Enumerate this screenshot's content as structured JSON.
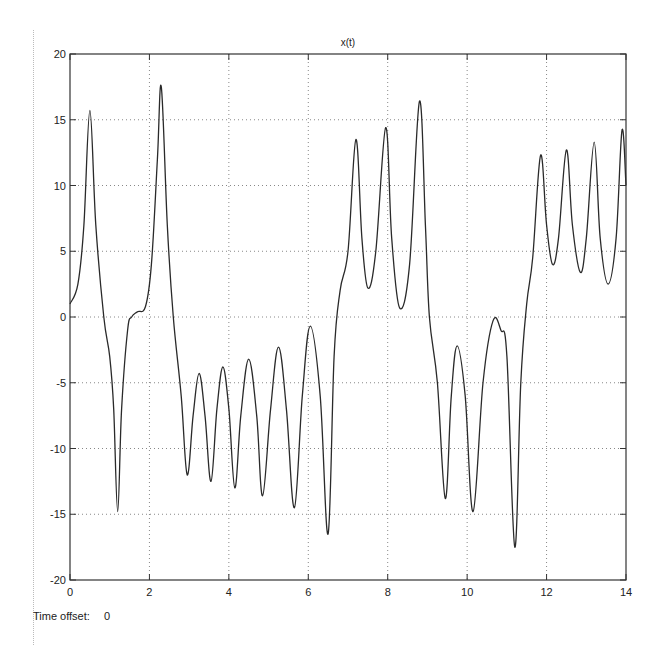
{
  "window": {
    "time_offset_label": "Time offset:",
    "time_offset_value": "0"
  },
  "chart_data": {
    "type": "line",
    "title": "x(t)",
    "xlabel": "",
    "ylabel": "",
    "xlim": [
      0,
      14
    ],
    "ylim": [
      -20,
      20
    ],
    "grid": true,
    "legend": null,
    "x_ticks": [
      0,
      2,
      4,
      6,
      8,
      10,
      12,
      14
    ],
    "y_ticks": [
      -20,
      -15,
      -10,
      -5,
      0,
      5,
      10,
      15,
      20
    ],
    "series": [
      {
        "name": "x(t)",
        "color": "#2a2a2a",
        "x": [
          0,
          0.2,
          0.35,
          0.5,
          0.65,
          0.85,
          1.0,
          1.1,
          1.2,
          1.3,
          1.45,
          1.55,
          1.7,
          1.9,
          2.05,
          2.2,
          2.3,
          2.45,
          2.6,
          2.8,
          2.95,
          3.1,
          3.25,
          3.4,
          3.55,
          3.7,
          3.85,
          4.0,
          4.15,
          4.3,
          4.5,
          4.7,
          4.85,
          5.05,
          5.25,
          5.45,
          5.65,
          5.85,
          6.05,
          6.3,
          6.5,
          6.65,
          6.8,
          7.0,
          7.2,
          7.35,
          7.5,
          7.7,
          7.95,
          8.1,
          8.3,
          8.55,
          8.8,
          8.95,
          9.05,
          9.25,
          9.45,
          9.6,
          9.75,
          9.95,
          10.15,
          10.4,
          10.65,
          10.85,
          11.0,
          11.2,
          11.35,
          11.5,
          11.65,
          11.85,
          12.0,
          12.15,
          12.3,
          12.5,
          12.65,
          12.85,
          13.0,
          13.2,
          13.35,
          13.55,
          13.75,
          13.9,
          14.0
        ],
        "values": [
          1,
          2.5,
          7,
          15.7,
          7,
          0,
          -3,
          -7,
          -14.8,
          -7,
          -1,
          0,
          0.4,
          0.8,
          4,
          12,
          17.5,
          7,
          0,
          -6,
          -12,
          -7.5,
          -4.3,
          -7.5,
          -12.5,
          -7,
          -3.8,
          -7,
          -13,
          -7.5,
          -3.2,
          -7.5,
          -13.6,
          -7,
          -2.3,
          -7,
          -14.5,
          -6,
          -0.7,
          -6,
          -16.5,
          -3,
          2,
          5,
          13.5,
          6,
          2.2,
          5,
          14.4,
          6,
          0.7,
          4,
          16.4,
          7,
          0,
          -5,
          -13.8,
          -6,
          -2.2,
          -6,
          -14.8,
          -5,
          -0.3,
          -1,
          -3,
          -17.5,
          -5,
          1,
          4.5,
          12.3,
          7,
          4,
          6,
          12.7,
          7,
          3.4,
          6,
          13.3,
          6,
          2.5,
          6,
          14.2,
          10
        ]
      }
    ]
  }
}
